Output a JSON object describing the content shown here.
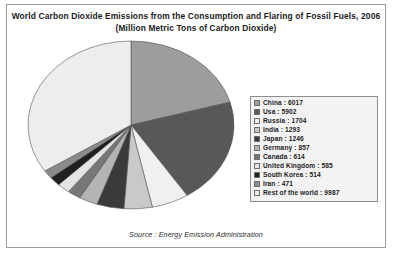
{
  "chart_data": {
    "type": "pie",
    "title": "World Carbon Dioxide Emissions from the Consumption and Flaring of Fossil Fuels, 2006",
    "subtitle": "(Million Metric Tons of Carbon Dioxide)",
    "source": "Source : Energy Emission Administration",
    "unit": "Million Metric Tons of Carbon Dioxide",
    "total": 29190,
    "legend_position": "right",
    "grid": false,
    "categories": [
      "China",
      "Usa",
      "Russia",
      "India",
      "Japan",
      "Germany",
      "Canada",
      "United Kingdom",
      "South Korea",
      "Iran",
      "Rest of the world"
    ],
    "values": [
      6017,
      5902,
      1704,
      1293,
      1246,
      857,
      614,
      585,
      514,
      471,
      9987
    ],
    "slice_colors": [
      "#9d9d9d",
      "#585858",
      "#f0f0f0",
      "#c9c9c9",
      "#3a3a3a",
      "#b4b4b4",
      "#777777",
      "#e4e4e4",
      "#1f1f1f",
      "#8a8a8a",
      "#ededed"
    ],
    "legend_entries": [
      {
        "label": "China : 6017",
        "color": "#9d9d9d"
      },
      {
        "label": "Usa : 5902",
        "color": "#585858"
      },
      {
        "label": "Russia : 1704",
        "color": "#f0f0f0"
      },
      {
        "label": "India : 1293",
        "color": "#c9c9c9"
      },
      {
        "label": "Japan : 1246",
        "color": "#3a3a3a"
      },
      {
        "label": "Germany : 857",
        "color": "#b4b4b4"
      },
      {
        "label": "Canada : 614",
        "color": "#777777"
      },
      {
        "label": "United Kingdom : 585",
        "color": "#e4e4e4"
      },
      {
        "label": "South Korea : 514",
        "color": "#1f1f1f"
      },
      {
        "label": "Iran : 471",
        "color": "#8a8a8a"
      },
      {
        "label": "Rest of the world : 9987",
        "color": "#ededed"
      }
    ]
  }
}
